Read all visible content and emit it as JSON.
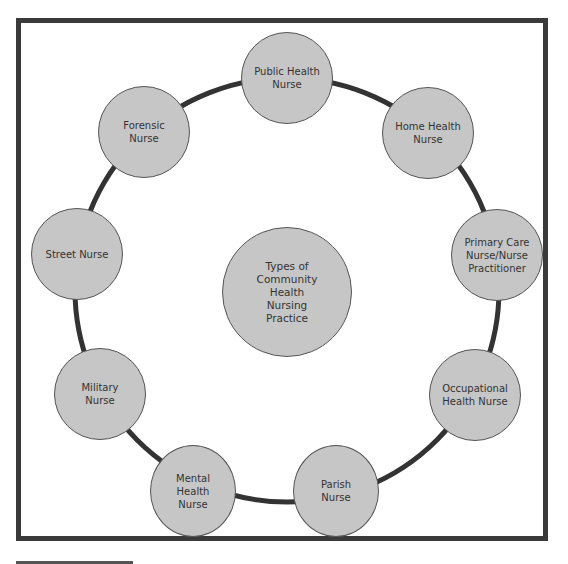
{
  "diagram": {
    "center": {
      "label": "Types of Community Health Nursing Practice",
      "lines": [
        "Types of",
        "Community",
        "Health",
        "Nursing",
        "Practice"
      ]
    },
    "nodes": [
      {
        "id": "public-health",
        "lines": [
          "Public Health",
          "Nurse"
        ]
      },
      {
        "id": "home-health",
        "lines": [
          "Home Health",
          "Nurse"
        ]
      },
      {
        "id": "primary-care",
        "lines": [
          "Primary Care",
          "Nurse/Nurse",
          "Practitioner"
        ]
      },
      {
        "id": "occupational",
        "lines": [
          "Occupational",
          "Health Nurse"
        ]
      },
      {
        "id": "parish",
        "lines": [
          "Parish Nurse"
        ]
      },
      {
        "id": "mental-health",
        "lines": [
          "Mental",
          "Health Nurse"
        ]
      },
      {
        "id": "military",
        "lines": [
          "Military",
          "Nurse"
        ]
      },
      {
        "id": "street",
        "lines": [
          "Street Nurse"
        ]
      },
      {
        "id": "forensic",
        "lines": [
          "Forensic Nurse"
        ]
      }
    ],
    "colors": {
      "node_fill": "#c6c6c6",
      "ring": "#333333",
      "frame": "#3a3a3a"
    }
  }
}
